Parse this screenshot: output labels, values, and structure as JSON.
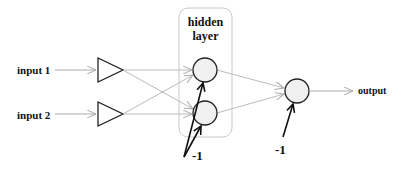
{
  "diagram": {
    "inputs": [
      {
        "label": "input 1"
      },
      {
        "label": "input 2"
      }
    ],
    "hidden_layer": {
      "label_line1": "hidden",
      "label_line2": "layer",
      "neurons": 2
    },
    "output": {
      "label": "output"
    },
    "bias": {
      "hidden_label": "-1",
      "output_label": "-1"
    },
    "colors": {
      "connection": "#b8b8b8",
      "neuron_fill": "#f0f0f0",
      "neuron_stroke": "#222222",
      "box_stroke": "#c8c8c8",
      "bias_arrow": "#111111"
    }
  }
}
